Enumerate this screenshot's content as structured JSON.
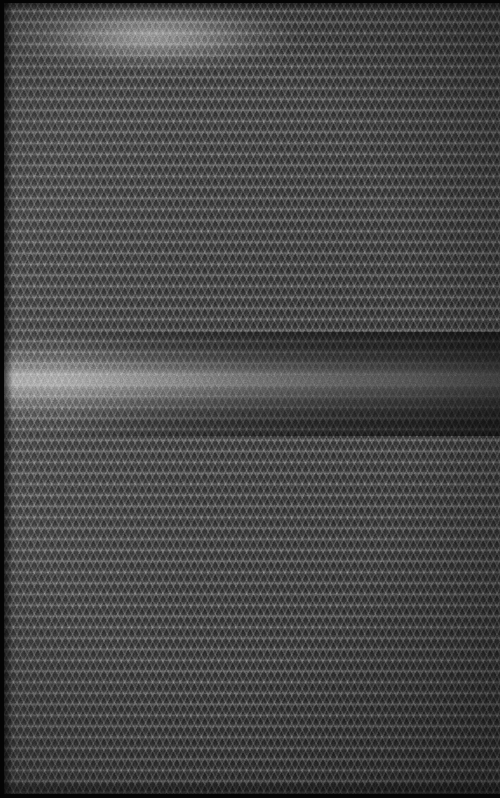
{
  "image": {
    "subject": "close-up macro photograph of dark gray woven mesh fabric",
    "alt_text": "Extreme close-up of a dark charcoal gray woven textile with a repeating diamond lattice weave, lit by a bright horizontal specular highlight across the middle",
    "width_px": 500,
    "height_px": 798,
    "orientation": "portrait",
    "color_mode": "monochrome"
  },
  "palette": {
    "base_fabric": "#3a3a3a",
    "weave_highlight": "#6e6e6e",
    "weave_shadow": "#262626",
    "glare_peak": "#d8d8d8",
    "frame_edge": "#050505",
    "background": "#2f2f2f"
  },
  "texture": {
    "pattern_name": "diamond-lattice-weave",
    "weft_row_period_px": 11,
    "warp_thread_period_px": 5.6,
    "diagonal_angle_deg": 63,
    "cell_shape": "x-cross-diamond"
  },
  "lighting": {
    "highlight_label": "specular glare band",
    "band_top_px": 332,
    "band_height_px": 104,
    "band_peak_y_px": 378,
    "brightest_side": "left",
    "falloff_direction": "left-to-right",
    "vignette": "soft radial darkening toward edges"
  },
  "frame": {
    "top_edge_px": 3,
    "left_edge_px": 4,
    "bottom_edge_px": 4,
    "right_edge_px": 0
  }
}
